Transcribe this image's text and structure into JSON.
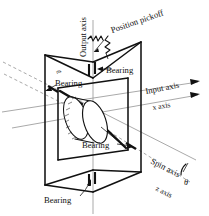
{
  "figure": {
    "background_color": "#ffffff",
    "line_color": "#111111",
    "axis_color": "#999999"
  },
  "labels": {
    "output_axis": "Output axis",
    "position_pickoff": "Position pickoff",
    "input_axis": "Input axis",
    "x_axis": "x axis",
    "spin_axis": "Spin axis",
    "z_axis": "z axis",
    "theta": "θ",
    "bearing_top": "Bearing",
    "bearing_left": "Bearing",
    "bearing_center": "Bearing",
    "bearing_bottom": "Bearing",
    "part_mark": "rts"
  },
  "bearings": [
    {
      "id": "bearing-top",
      "label": "Bearing"
    },
    {
      "id": "bearing-left",
      "label": "Bearing"
    },
    {
      "id": "bearing-center",
      "label": "Bearing"
    },
    {
      "id": "bearing-bottom",
      "label": "Bearing"
    }
  ],
  "axes": [
    {
      "id": "output-axis",
      "label": "Output axis",
      "orientation": "vertical"
    },
    {
      "id": "input-axis",
      "label": "Input axis",
      "orientation": "right-up"
    },
    {
      "id": "x-axis",
      "label": "x axis",
      "orientation": "right-up"
    },
    {
      "id": "spin-axis",
      "label": "Spin axis",
      "orientation": "down-right"
    },
    {
      "id": "z-axis",
      "label": "z axis",
      "orientation": "down-right"
    }
  ]
}
